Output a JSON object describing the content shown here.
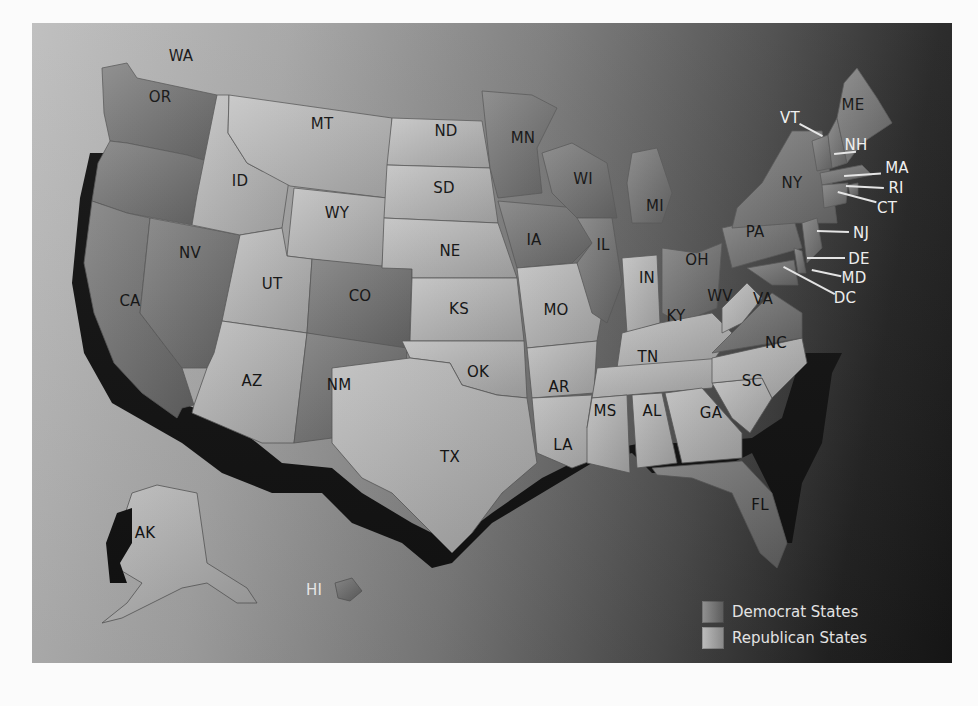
{
  "map": {
    "title": "",
    "legend": [
      {
        "key": "dem",
        "label": "Democrat States"
      },
      {
        "key": "rep",
        "label": "Republican States"
      }
    ],
    "colors": {
      "democrat_shade": "#6e6e6e",
      "republican_shade": "#b0b0b0",
      "water_gradient_left": "#bdbdbd",
      "water_gradient_right": "#161616",
      "coast_shadow": "#111111",
      "callout_text": "#f0f0f0"
    },
    "states": [
      {
        "abbr": "WA",
        "party": "dem"
      },
      {
        "abbr": "OR",
        "party": "dem"
      },
      {
        "abbr": "CA",
        "party": "dem"
      },
      {
        "abbr": "NV",
        "party": "dem"
      },
      {
        "abbr": "ID",
        "party": "rep"
      },
      {
        "abbr": "MT",
        "party": "rep"
      },
      {
        "abbr": "WY",
        "party": "rep"
      },
      {
        "abbr": "UT",
        "party": "rep"
      },
      {
        "abbr": "AZ",
        "party": "rep"
      },
      {
        "abbr": "CO",
        "party": "dem"
      },
      {
        "abbr": "NM",
        "party": "dem"
      },
      {
        "abbr": "ND",
        "party": "rep"
      },
      {
        "abbr": "SD",
        "party": "rep"
      },
      {
        "abbr": "NE",
        "party": "rep"
      },
      {
        "abbr": "KS",
        "party": "rep"
      },
      {
        "abbr": "OK",
        "party": "rep"
      },
      {
        "abbr": "TX",
        "party": "rep"
      },
      {
        "abbr": "MN",
        "party": "dem"
      },
      {
        "abbr": "IA",
        "party": "dem"
      },
      {
        "abbr": "MO",
        "party": "rep"
      },
      {
        "abbr": "AR",
        "party": "rep"
      },
      {
        "abbr": "LA",
        "party": "rep"
      },
      {
        "abbr": "WI",
        "party": "dem"
      },
      {
        "abbr": "IL",
        "party": "dem"
      },
      {
        "abbr": "MI",
        "party": "dem"
      },
      {
        "abbr": "IN",
        "party": "rep"
      },
      {
        "abbr": "OH",
        "party": "dem"
      },
      {
        "abbr": "KY",
        "party": "rep"
      },
      {
        "abbr": "TN",
        "party": "rep"
      },
      {
        "abbr": "MS",
        "party": "rep"
      },
      {
        "abbr": "AL",
        "party": "rep"
      },
      {
        "abbr": "GA",
        "party": "rep"
      },
      {
        "abbr": "FL",
        "party": "dem"
      },
      {
        "abbr": "SC",
        "party": "rep"
      },
      {
        "abbr": "NC",
        "party": "rep"
      },
      {
        "abbr": "VA",
        "party": "dem"
      },
      {
        "abbr": "WV",
        "party": "rep"
      },
      {
        "abbr": "PA",
        "party": "dem"
      },
      {
        "abbr": "NY",
        "party": "dem"
      },
      {
        "abbr": "VT",
        "party": "dem"
      },
      {
        "abbr": "NH",
        "party": "dem"
      },
      {
        "abbr": "ME",
        "party": "dem"
      },
      {
        "abbr": "MA",
        "party": "dem"
      },
      {
        "abbr": "RI",
        "party": "dem"
      },
      {
        "abbr": "CT",
        "party": "dem"
      },
      {
        "abbr": "NJ",
        "party": "dem"
      },
      {
        "abbr": "DE",
        "party": "dem"
      },
      {
        "abbr": "MD",
        "party": "dem"
      },
      {
        "abbr": "DC",
        "party": "dem"
      },
      {
        "abbr": "AK",
        "party": "rep"
      },
      {
        "abbr": "HI",
        "party": "dem"
      }
    ],
    "labels": {
      "WA": "WA",
      "OR": "OR",
      "CA": "CA",
      "NV": "NV",
      "ID": "ID",
      "MT": "MT",
      "WY": "WY",
      "UT": "UT",
      "AZ": "AZ",
      "CO": "CO",
      "NM": "NM",
      "ND": "ND",
      "SD": "SD",
      "NE": "NE",
      "KS": "KS",
      "OK": "OK",
      "TX": "TX",
      "MN": "MN",
      "IA": "IA",
      "MO": "MO",
      "AR": "AR",
      "LA": "LA",
      "WI": "WI",
      "IL": "IL",
      "MI": "MI",
      "IN": "IN",
      "OH": "OH",
      "KY": "KY",
      "TN": "TN",
      "MS": "MS",
      "AL": "AL",
      "GA": "GA",
      "FL": "FL",
      "SC": "SC",
      "NC": "NC",
      "VA": "VA",
      "WV": "WV",
      "PA": "PA",
      "NY": "NY",
      "VT": "VT",
      "NH": "NH",
      "ME": "ME",
      "MA": "MA",
      "RI": "RI",
      "CT": "CT",
      "NJ": "NJ",
      "DE": "DE",
      "MD": "MD",
      "DC": "DC",
      "AK": "AK",
      "HI": "HI"
    }
  }
}
